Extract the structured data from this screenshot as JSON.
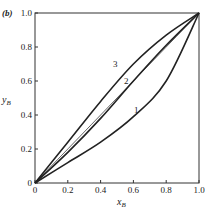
{
  "panel_label": "(b)",
  "chart_data": {
    "type": "line",
    "title": "",
    "xlabel": "x_B",
    "ylabel": "y_B",
    "xlim": [
      0,
      1.0
    ],
    "ylim": [
      0,
      1.0
    ],
    "grid": false,
    "legend": "none",
    "xticks": [
      "0",
      "0.2",
      "0.4",
      "0.6",
      "0.8",
      "1.0"
    ],
    "yticks": [
      "0",
      "0.2",
      "0.4",
      "0.6",
      "0.8",
      "1.0"
    ],
    "series": [
      {
        "name": "1",
        "x": [
          0,
          0.2,
          0.4,
          0.6,
          0.8,
          1.0
        ],
        "y": [
          0,
          0.12,
          0.24,
          0.39,
          0.6,
          1.0
        ]
      },
      {
        "name": "2",
        "x": [
          0,
          0.2,
          0.4,
          0.6,
          0.8,
          1.0
        ],
        "y": [
          0,
          0.18,
          0.38,
          0.6,
          0.81,
          1.0
        ]
      },
      {
        "name": "3",
        "x": [
          0,
          0.2,
          0.4,
          0.6,
          0.8,
          1.0
        ],
        "y": [
          0,
          0.24,
          0.48,
          0.7,
          0.87,
          1.0
        ]
      },
      {
        "name": "diagonal",
        "x": [
          0,
          1.0
        ],
        "y": [
          0,
          1.0
        ]
      }
    ],
    "annotations": [
      "1",
      "2",
      "3"
    ]
  }
}
